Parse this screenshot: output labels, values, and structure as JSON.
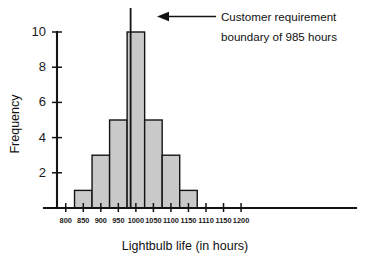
{
  "chart_data": {
    "type": "bar",
    "title": "",
    "subtitle": "",
    "xlabel": "Lightbulb life (in hours)",
    "ylabel": "Frequency",
    "categories": [
      "850",
      "900",
      "950",
      "1000",
      "1050",
      "1100",
      "1150"
    ],
    "values": [
      1,
      3,
      5,
      10,
      5,
      3,
      1
    ],
    "bar_centers": [
      850,
      900,
      950,
      1000,
      1050,
      1100,
      1150
    ],
    "bin_width": 50,
    "ylim": [
      0,
      10
    ],
    "yticks": [
      "2",
      "4",
      "6",
      "8",
      "10"
    ],
    "ytick_values": [
      2,
      4,
      6,
      8,
      10
    ],
    "xticks": [
      "800",
      "850",
      "900",
      "950",
      "1000",
      "1050",
      "1100",
      "1150",
      "1110",
      "1150",
      "1200"
    ],
    "xtick_positions": [
      800,
      850,
      900,
      950,
      1000,
      1050,
      1100,
      1150,
      1200,
      1250,
      1300
    ],
    "grid": false,
    "legend": "none",
    "bar_fill_color": "#c9c9c9",
    "bar_edge_color": "#141414",
    "axis_color": "#141414",
    "annotations": [
      {
        "name": "customer-requirement-boundary",
        "line1": "Customer requirement",
        "line2": "boundary of 985 hours",
        "marker_type": "vertical-line-with-arrow",
        "marker_x_value": 985,
        "arrow_direction": "left"
      }
    ]
  }
}
